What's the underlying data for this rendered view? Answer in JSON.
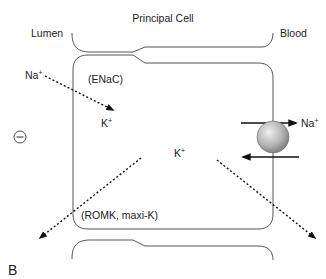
{
  "diagram": {
    "title": "Principal Cell",
    "regions": {
      "lumen": "Lumen",
      "blood": "Blood"
    },
    "charge_symbol": "⊖",
    "channels": {
      "apical_na": "(ENaC)",
      "apical_k": "(ROMK, maxi-K)"
    },
    "ions": {
      "na_lumen": "Na",
      "na_lumen_sup": "+",
      "k_apical": "K",
      "k_apical_sup": "+",
      "k_cell": "K",
      "k_cell_sup": "+",
      "na_blood": "Na",
      "na_blood_sup": "+"
    },
    "pump": {
      "name": "Na/K pump",
      "color_light": "#e8e8e8",
      "color_dark": "#7a7a7a"
    },
    "panel_label": "B"
  }
}
